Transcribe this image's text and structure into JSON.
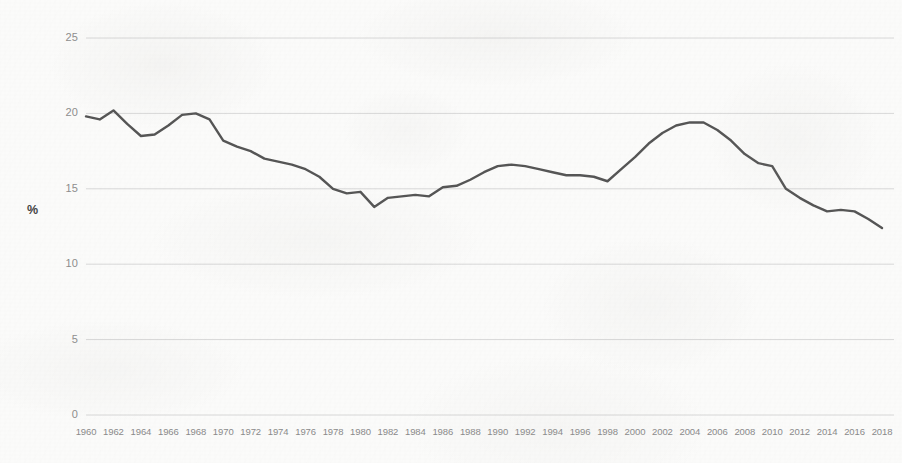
{
  "chart_data": {
    "type": "line",
    "title": "",
    "subtitle": "",
    "xlabel": "",
    "ylabel": "%",
    "xlim": [
      1960,
      2018
    ],
    "ylim": [
      0,
      25
    ],
    "grid": true,
    "grid_axis": "y",
    "legend": false,
    "legend_position": "none",
    "line_color": "#555555",
    "gridline_color": "#d8d8d8",
    "background_color": "#fbfbfa",
    "y_ticks": [
      "0",
      "5",
      "10",
      "15",
      "20",
      "25"
    ],
    "y_tick_values": [
      0,
      5,
      10,
      15,
      20,
      25
    ],
    "x_tick_labels": [
      "1960",
      "1962",
      "1964",
      "1966",
      "1968",
      "1970",
      "1972",
      "1974",
      "1976",
      "1978",
      "1980",
      "1982",
      "1984",
      "1986",
      "1988",
      "1990",
      "1992",
      "1994",
      "1996",
      "1998",
      "2000",
      "2002",
      "2004",
      "2006",
      "2008",
      "2010",
      "2012",
      "2014",
      "2016",
      "2018"
    ],
    "series": [
      {
        "name": "%",
        "x": [
          1960,
          1961,
          1962,
          1963,
          1964,
          1965,
          1966,
          1967,
          1968,
          1969,
          1970,
          1971,
          1972,
          1973,
          1974,
          1975,
          1976,
          1977,
          1978,
          1979,
          1980,
          1981,
          1982,
          1983,
          1984,
          1985,
          1986,
          1987,
          1988,
          1989,
          1990,
          1991,
          1992,
          1993,
          1994,
          1995,
          1996,
          1997,
          1998,
          1999,
          2000,
          2001,
          2002,
          2003,
          2004,
          2005,
          2006,
          2007,
          2008,
          2009,
          2010,
          2011,
          2012,
          2013,
          2014,
          2015,
          2016,
          2017,
          2018
        ],
        "values": [
          19.8,
          19.6,
          20.2,
          19.3,
          18.5,
          18.6,
          19.2,
          19.9,
          20.0,
          19.6,
          18.2,
          17.8,
          17.5,
          17.0,
          16.8,
          16.6,
          16.3,
          15.8,
          15.0,
          14.7,
          14.8,
          13.8,
          14.4,
          14.5,
          14.6,
          14.5,
          15.1,
          15.2,
          15.6,
          16.1,
          16.5,
          16.6,
          16.5,
          16.3,
          16.1,
          15.9,
          15.9,
          15.8,
          15.5,
          16.3,
          17.1,
          18.0,
          18.7,
          19.2,
          19.4,
          19.4,
          18.9,
          18.2,
          17.3,
          16.7,
          16.5,
          15.0,
          14.4,
          13.9,
          13.5,
          13.6,
          13.5,
          13.0,
          12.4
        ]
      }
    ]
  },
  "axes": {
    "y_title": "%"
  }
}
